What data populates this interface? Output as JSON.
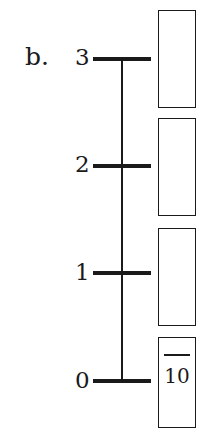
{
  "problem_label": "b.",
  "number_line": {
    "ticks": [
      {
        "value": "3"
      },
      {
        "value": "2"
      },
      {
        "value": "1"
      },
      {
        "value": "0"
      }
    ]
  },
  "boxes": [
    {
      "numerator": "",
      "denominator": ""
    },
    {
      "numerator": "",
      "denominator": ""
    },
    {
      "numerator": "",
      "denominator": ""
    },
    {
      "numerator": "",
      "denominator": "10"
    }
  ]
}
